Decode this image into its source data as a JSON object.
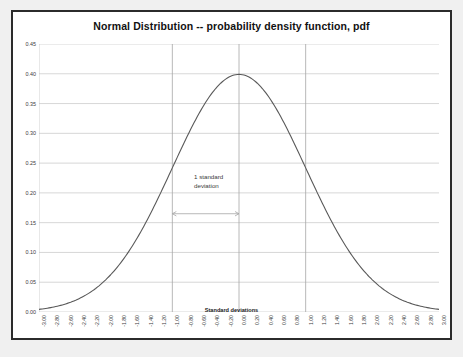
{
  "chart_data": {
    "type": "line",
    "title": "Normal Distribution -- probability density function, pdf",
    "xlabel": "Standard deviations",
    "ylabel": "",
    "xlim": [
      -3.0,
      3.0
    ],
    "ylim": [
      0.0,
      0.45
    ],
    "grid": true,
    "legend": null,
    "series": [
      {
        "name": "pdf",
        "color": "#595959",
        "x": [
          -3.0,
          -2.8,
          -2.6,
          -2.4,
          -2.2,
          -2.0,
          -1.8,
          -1.6,
          -1.4,
          -1.2,
          -1.0,
          -0.8,
          -0.6,
          -0.4,
          -0.2,
          0.0,
          0.2,
          0.4,
          0.6,
          0.8,
          1.0,
          1.2,
          1.4,
          1.6,
          1.8,
          2.0,
          2.2,
          2.4,
          2.6,
          2.8,
          3.0
        ],
        "values": [
          0.0044,
          0.0079,
          0.0136,
          0.0224,
          0.0355,
          0.054,
          0.079,
          0.1109,
          0.1497,
          0.1942,
          0.242,
          0.2897,
          0.3332,
          0.3683,
          0.391,
          0.3989,
          0.391,
          0.3683,
          0.3332,
          0.2897,
          0.242,
          0.1942,
          0.1497,
          0.1109,
          0.079,
          0.054,
          0.0355,
          0.0224,
          0.0136,
          0.0079,
          0.0044
        ]
      }
    ],
    "x_tick_labels": [
      "-3.00",
      "-2.80",
      "-2.60",
      "-2.40",
      "-2.20",
      "-2.00",
      "-1.80",
      "-1.60",
      "-1.40",
      "-1.20",
      "-1.00",
      "-0.80",
      "-0.60",
      "-0.40",
      "-0.20",
      "0.00",
      "0.20",
      "0.40",
      "0.60",
      "0.80",
      "1.00",
      "1.20",
      "1.40",
      "1.60",
      "1.80",
      "2.00",
      "2.20",
      "2.40",
      "2.60",
      "2.80",
      "3.00"
    ],
    "x_ticks": [
      -3.0,
      -2.8,
      -2.6,
      -2.4,
      -2.2,
      -2.0,
      -1.8,
      -1.6,
      -1.4,
      -1.2,
      -1.0,
      -0.8,
      -0.6,
      -0.4,
      -0.2,
      0.0,
      0.2,
      0.4,
      0.6,
      0.8,
      1.0,
      1.2,
      1.4,
      1.6,
      1.8,
      2.0,
      2.2,
      2.4,
      2.6,
      2.8,
      3.0
    ],
    "y_tick_labels": [
      "0.00",
      "0.05",
      "0.10",
      "0.15",
      "0.20",
      "0.25",
      "0.30",
      "0.35",
      "0.40",
      "0.45"
    ],
    "y_ticks": [
      0.0,
      0.05,
      0.1,
      0.15,
      0.2,
      0.25,
      0.3,
      0.35,
      0.4,
      0.45
    ],
    "vertical_markers": [
      -1.0,
      0.0,
      1.0
    ],
    "annotations": [
      {
        "text_line1": "1 standard",
        "text_line2": "deviation",
        "arrow_from": -1.0,
        "arrow_to": 0.0,
        "arrow_y": 0.165,
        "double_headed": true
      }
    ],
    "colors": {
      "curve": "#595959",
      "gridline": "#c6c6c6",
      "marker_line": "#a6a6a6",
      "axis_text": "#3a3a3a",
      "title_text": "#111111",
      "plot_background": "#ffffff",
      "page_background": "#f0f0f0",
      "frame_border": "#2b2b2b"
    }
  }
}
